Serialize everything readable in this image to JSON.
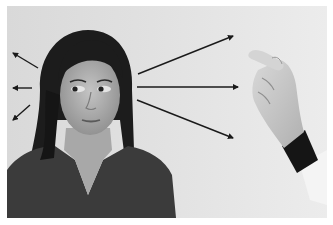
{
  "image": {
    "description": "Grayscale photograph of a young woman with long dark hair looking to her right, with arrows radiating left and right from her eyes, and a gloved-cuff hand on the right holding up a finger as a visual target",
    "style": "grayscale photograph",
    "colors": {
      "background_outer": "#ffffff",
      "backdrop": "#e0e0e0",
      "hair": "#1c1c1c",
      "skin": "#b5b5b5",
      "shirt": "#3a3a3a",
      "arrow": "#1a1a1a",
      "hand": "#cfcfcf",
      "cuff": "#151515",
      "sleeve": "#f2f2f2"
    },
    "arrows": {
      "left": [
        {
          "from": [
            38,
            68
          ],
          "to": [
            13,
            53
          ]
        },
        {
          "from": [
            32,
            88
          ],
          "to": [
            13,
            88
          ]
        },
        {
          "from": [
            30,
            105
          ],
          "to": [
            13,
            120
          ]
        }
      ],
      "right": [
        {
          "from": [
            138,
            74
          ],
          "to": [
            233,
            36
          ]
        },
        {
          "from": [
            137,
            87
          ],
          "to": [
            238,
            87
          ]
        },
        {
          "from": [
            137,
            100
          ],
          "to": [
            233,
            138
          ]
        }
      ]
    },
    "subjects": [
      "woman",
      "hand-with-raised-finger"
    ]
  }
}
